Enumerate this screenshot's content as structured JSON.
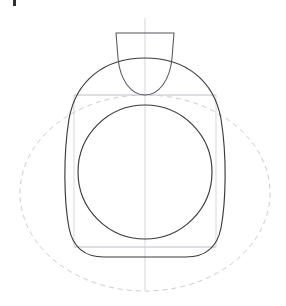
{
  "canvas": {
    "width": 286,
    "height": 306,
    "background": "#ffffff",
    "title": "Geometric construction drawing"
  },
  "palette": {
    "dark_stroke": "#3a3a3f",
    "mid_stroke": "#55555c",
    "light_stroke": "#bdbdc2",
    "guide_stroke": "#cfcfd4",
    "dashed_stroke": "#c2c2c8",
    "corner_mark": "#2e2e33",
    "background": "#ffffff"
  },
  "artifacts": {
    "top_left_mark": {
      "name": "cropped-glyph-fragment",
      "x": 13,
      "y": 0,
      "width": 3,
      "height": 6,
      "color": "#2e2e33"
    }
  },
  "shapes": {
    "center_axis": {
      "name": "vertical-center-line",
      "x": 145,
      "y_top": 18,
      "y_bottom": 290,
      "color": "#cfcfd4",
      "path": "M 145 18 L 145 290"
    },
    "cap": {
      "name": "top-cap-outline",
      "top_y": 33,
      "left_x": 116,
      "right_x": 174,
      "bottom_y": 95,
      "color": "#55555c",
      "path": "M 116 33 L 174 33 L 171 60 C 168 80 158 95 145 95 C 132 95 122 80 119 60 Z"
    },
    "outer_squircle": {
      "name": "outer-rounded-square-outline",
      "left_x": 66,
      "right_x": 224,
      "top_y": 58,
      "bottom_y": 257,
      "color": "#3a3a3f",
      "path": "M 145 58 C 185 58 215 80 222 120 C 227 155 226 200 221 228 C 217 248 205 257 186 257 L 104 257 C 85 257 73 248 69 228 C 64 200 63 155 68 120 C 75 80 105 58 145 58 Z"
    },
    "inner_circle": {
      "name": "inner-circle-outline",
      "center_x": 145,
      "center_y": 172,
      "radius": 67,
      "color": "#3a3a3f"
    },
    "guide_rect": {
      "name": "bounding-square-guide",
      "x": 74,
      "y": 95,
      "width": 142,
      "height": 152,
      "color": "#cfcfd4"
    },
    "dashed_ellipse": {
      "name": "dashed-ellipse-guide",
      "center_x": 145,
      "center_y": 193,
      "rx": 125,
      "ry": 98,
      "color": "#c2c2c8",
      "dash": "5 4"
    },
    "guide_horizontal_top": {
      "name": "upper-horizontal-guide",
      "y": 95,
      "x_start": 74,
      "x_end": 216,
      "color": "#cfcfd4"
    },
    "guide_horizontal_bottom": {
      "name": "lower-horizontal-guide",
      "y": 247,
      "x_start": 74,
      "x_end": 216,
      "color": "#cfcfd4"
    }
  }
}
